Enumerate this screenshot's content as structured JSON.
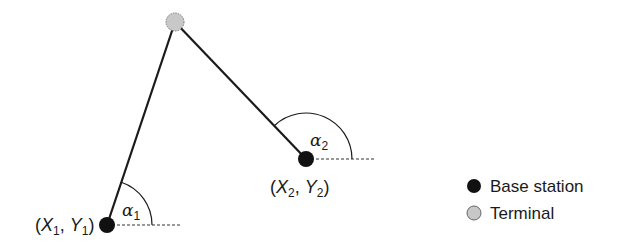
{
  "diagram": {
    "terminal": {
      "label": "Terminal",
      "x": 175,
      "y": 22,
      "color": "#c8c8c8"
    },
    "base_stations": [
      {
        "id": 1,
        "coord_label_x": "X",
        "coord_label_y": "Y",
        "sub": "1",
        "angle_label": "α",
        "angle_sub": "1",
        "x": 107,
        "y": 225
      },
      {
        "id": 2,
        "coord_label_x": "X",
        "coord_label_y": "Y",
        "sub": "2",
        "angle_label": "α",
        "angle_sub": "2",
        "x": 306,
        "y": 159
      }
    ],
    "base_station_color": "#111111",
    "legend": {
      "items": [
        {
          "label": "Base station",
          "symbol": "filled-black-circle"
        },
        {
          "label": "Terminal",
          "symbol": "filled-gray-circle"
        }
      ]
    }
  }
}
